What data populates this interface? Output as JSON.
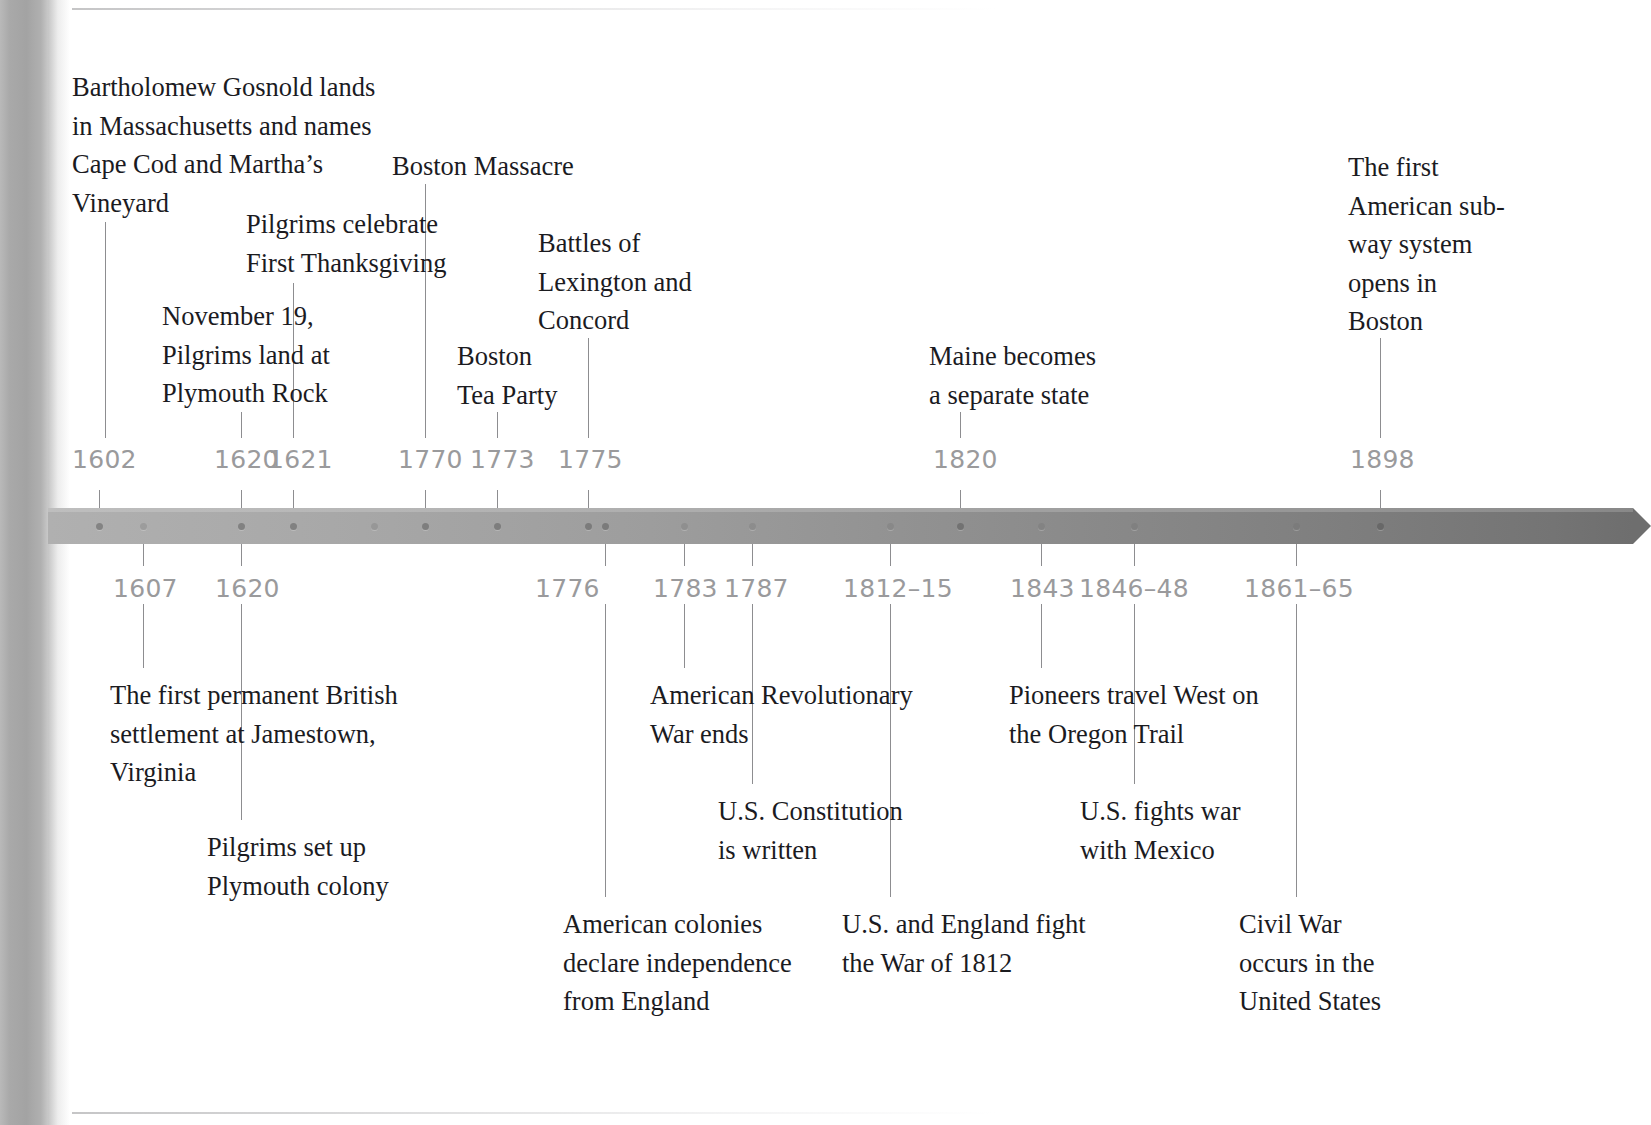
{
  "page": {
    "background_color": "#ffffff",
    "text_color": "#1b1b1f",
    "year_color": "#9a9a9c",
    "leader_color": "#8d8d90",
    "bar_color_left": "#b0b0b0",
    "bar_color_right": "#6e6e6e"
  },
  "timeline": {
    "bar": {
      "x": 48,
      "y": 508,
      "width": 1585,
      "height": 36
    },
    "arrow": {
      "x": 1633,
      "y": 508,
      "height": 36,
      "width": 18
    },
    "dots": [
      {
        "x": 99,
        "faint": false
      },
      {
        "x": 143,
        "faint": true
      },
      {
        "x": 241,
        "faint": false
      },
      {
        "x": 293,
        "faint": false
      },
      {
        "x": 374,
        "faint": true
      },
      {
        "x": 425,
        "faint": false
      },
      {
        "x": 497,
        "faint": false
      },
      {
        "x": 588,
        "faint": false
      },
      {
        "x": 605,
        "faint": false
      },
      {
        "x": 684,
        "faint": true
      },
      {
        "x": 752,
        "faint": true
      },
      {
        "x": 890,
        "faint": true
      },
      {
        "x": 960,
        "faint": false
      },
      {
        "x": 1041,
        "faint": true
      },
      {
        "x": 1134,
        "faint": true
      },
      {
        "x": 1296,
        "faint": true
      },
      {
        "x": 1380,
        "faint": false
      }
    ]
  },
  "rules": [
    {
      "name": "top-rule",
      "x": 72,
      "y": 8,
      "width": 925
    },
    {
      "name": "bottom-rule",
      "x": 72,
      "y": 1112,
      "width": 925
    }
  ],
  "years_above": [
    {
      "label": "1602",
      "x": 72,
      "y": 447,
      "tick_x": 99,
      "tick_top": 490,
      "tick_bottom": 508
    },
    {
      "label": "1620",
      "x": 214,
      "y": 447,
      "tick_x": 241,
      "tick_top": 490,
      "tick_bottom": 508
    },
    {
      "label": "1621",
      "x": 268,
      "y": 447,
      "tick_x": 293,
      "tick_top": 490,
      "tick_bottom": 508
    },
    {
      "label": "1770",
      "x": 398,
      "y": 447,
      "tick_x": 425,
      "tick_top": 490,
      "tick_bottom": 508
    },
    {
      "label": "1773",
      "x": 470,
      "y": 447,
      "tick_x": 497,
      "tick_top": 490,
      "tick_bottom": 508
    },
    {
      "label": "1775",
      "x": 558,
      "y": 447,
      "tick_x": 588,
      "tick_top": 490,
      "tick_bottom": 508
    },
    {
      "label": "1820",
      "x": 933,
      "y": 447,
      "tick_x": 960,
      "tick_top": 490,
      "tick_bottom": 508
    },
    {
      "label": "1898",
      "x": 1350,
      "y": 447,
      "tick_x": 1380,
      "tick_top": 490,
      "tick_bottom": 508
    }
  ],
  "years_below": [
    {
      "label": "1607",
      "x": 113,
      "y": 576,
      "tick_x": 143,
      "tick_top": 544,
      "tick_bottom": 566
    },
    {
      "label": "1620",
      "x": 215,
      "y": 576,
      "tick_x": 241,
      "tick_top": 544,
      "tick_bottom": 566
    },
    {
      "label": "1776",
      "x": 535,
      "y": 576,
      "tick_x": 605,
      "tick_top": 544,
      "tick_bottom": 566
    },
    {
      "label": "1783",
      "x": 653,
      "y": 576,
      "tick_x": 684,
      "tick_top": 544,
      "tick_bottom": 566
    },
    {
      "label": "1787",
      "x": 724,
      "y": 576,
      "tick_x": 752,
      "tick_top": 544,
      "tick_bottom": 566
    },
    {
      "label": "1812–15",
      "x": 843,
      "y": 576,
      "tick_x": 890,
      "tick_top": 544,
      "tick_bottom": 566
    },
    {
      "label": "1843",
      "x": 1010,
      "y": 576,
      "tick_x": 1041,
      "tick_top": 544,
      "tick_bottom": 566
    },
    {
      "label": "1846–48",
      "x": 1079,
      "y": 576,
      "tick_x": 1134,
      "tick_top": 544,
      "tick_bottom": 566
    },
    {
      "label": "1861–65",
      "x": 1244,
      "y": 576,
      "tick_x": 1296,
      "tick_top": 544,
      "tick_bottom": 566
    }
  ],
  "events_above": [
    {
      "year": "1602",
      "text": "Bartholomew Gosnold lands\nin Massachusetts and names\nCape Cod and Martha’s\nVineyard",
      "x": 72,
      "y": 68,
      "width": 400,
      "leader": {
        "x": 105,
        "top": 222,
        "bottom": 438
      }
    },
    {
      "year": "1620",
      "text": "November 19,\nPilgrims land at\nPlymouth Rock",
      "x": 162,
      "y": 297,
      "width": 230,
      "leader": {
        "x": 241,
        "top": 412,
        "bottom": 438
      }
    },
    {
      "year": "1621",
      "text": "Pilgrims celebrate\nFirst Thanksgiving",
      "x": 246,
      "y": 205,
      "width": 240,
      "leader": {
        "x": 293,
        "top": 283,
        "bottom": 438
      }
    },
    {
      "year": "1770",
      "text": "Boston Massacre",
      "x": 392,
      "y": 147,
      "width": 210,
      "leader": {
        "x": 425,
        "top": 184,
        "bottom": 438
      }
    },
    {
      "year": "1773",
      "text": "Boston\nTea Party",
      "x": 457,
      "y": 337,
      "width": 150,
      "leader": {
        "x": 497,
        "top": 412,
        "bottom": 438
      }
    },
    {
      "year": "1775",
      "text": "Battles of\nLexington and\nConcord",
      "x": 538,
      "y": 224,
      "width": 200,
      "leader": {
        "x": 588,
        "top": 338,
        "bottom": 438
      }
    },
    {
      "year": "1820",
      "text": "Maine becomes\na separate state",
      "x": 929,
      "y": 337,
      "width": 220,
      "leader": {
        "x": 960,
        "top": 412,
        "bottom": 438
      }
    },
    {
      "year": "1898",
      "text": "The first\nAmerican sub-\nway system\nopens in\nBoston",
      "x": 1348,
      "y": 148,
      "width": 180,
      "leader": {
        "x": 1380,
        "top": 338,
        "bottom": 438
      }
    }
  ],
  "events_below": [
    {
      "year": "1607",
      "text": "The first permanent British\nsettlement at Jamestown,\nVirginia",
      "x": 110,
      "y": 676,
      "width": 350,
      "leader": {
        "x": 143,
        "top": 604,
        "bottom": 668
      }
    },
    {
      "year": "1620",
      "text": "Pilgrims set up\nPlymouth colony",
      "x": 207,
      "y": 828,
      "width": 230,
      "leader": {
        "x": 241,
        "top": 604,
        "bottom": 820
      }
    },
    {
      "year": "1776",
      "text": "American colonies\ndeclare independence\nfrom England",
      "x": 563,
      "y": 905,
      "width": 270,
      "leader": {
        "x": 605,
        "top": 604,
        "bottom": 897
      }
    },
    {
      "year": "1783",
      "text": "American Revolutionary\nWar ends",
      "x": 650,
      "y": 676,
      "width": 300,
      "leader": {
        "x": 684,
        "top": 604,
        "bottom": 668
      }
    },
    {
      "year": "1787",
      "text": "U.S. Constitution\nis written",
      "x": 718,
      "y": 792,
      "width": 230,
      "leader": {
        "x": 752,
        "top": 604,
        "bottom": 784
      }
    },
    {
      "year": "1812–15",
      "text": "U.S. and England fight\nthe War of 1812",
      "x": 842,
      "y": 905,
      "width": 290,
      "leader": {
        "x": 890,
        "top": 604,
        "bottom": 897
      }
    },
    {
      "year": "1843",
      "text": "Pioneers travel West on\nthe Oregon Trail",
      "x": 1009,
      "y": 676,
      "width": 300,
      "leader": {
        "x": 1041,
        "top": 604,
        "bottom": 668
      }
    },
    {
      "year": "1846–48",
      "text": "U.S. fights war\nwith Mexico",
      "x": 1080,
      "y": 792,
      "width": 210,
      "leader": {
        "x": 1134,
        "top": 604,
        "bottom": 784
      }
    },
    {
      "year": "1861–65",
      "text": "Civil War\noccurs in the\nUnited States",
      "x": 1239,
      "y": 905,
      "width": 200,
      "leader": {
        "x": 1296,
        "top": 604,
        "bottom": 897
      }
    }
  ]
}
